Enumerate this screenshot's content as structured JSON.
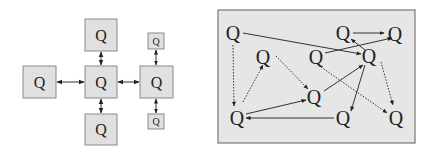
{
  "left_diagram": {
    "title": "centralized topology",
    "nodes": [
      {
        "id": "top",
        "label": "Q"
      },
      {
        "id": "left",
        "label": "Q"
      },
      {
        "id": "center",
        "label": "Q"
      },
      {
        "id": "right",
        "label": "Q"
      },
      {
        "id": "bottom",
        "label": "Q"
      },
      {
        "id": "small-top",
        "label": "Q"
      },
      {
        "id": "small-bottom",
        "label": "Q"
      }
    ],
    "edges": [
      {
        "from": "center",
        "to": "top",
        "type": "bidirectional"
      },
      {
        "from": "center",
        "to": "left",
        "type": "bidirectional"
      },
      {
        "from": "center",
        "to": "right",
        "type": "bidirectional"
      },
      {
        "from": "center",
        "to": "bottom",
        "type": "bidirectional"
      },
      {
        "from": "right",
        "to": "small-top",
        "type": "bidirectional"
      },
      {
        "from": "right",
        "to": "small-bottom",
        "type": "bidirectional"
      }
    ]
  },
  "right_diagram": {
    "title": "decentralized network",
    "nodes": [
      {
        "id": "a",
        "label": "Q"
      },
      {
        "id": "b",
        "label": "Q"
      },
      {
        "id": "c",
        "label": "Q"
      },
      {
        "id": "d",
        "label": "Q"
      },
      {
        "id": "e",
        "label": "Q"
      },
      {
        "id": "f",
        "label": "Q"
      },
      {
        "id": "g",
        "label": "Q"
      },
      {
        "id": "h",
        "label": "Q"
      },
      {
        "id": "i",
        "label": "Q"
      },
      {
        "id": "j",
        "label": "Q"
      }
    ],
    "edges": [
      {
        "from": "a",
        "to": "d",
        "style": "solid"
      },
      {
        "from": "a",
        "to": "h",
        "style": "dotted"
      },
      {
        "from": "e",
        "to": "f",
        "style": "solid"
      },
      {
        "from": "c",
        "to": "f",
        "style": "solid"
      },
      {
        "from": "d",
        "to": "e",
        "style": "solid"
      },
      {
        "from": "b",
        "to": "g",
        "style": "dotted"
      },
      {
        "from": "h",
        "to": "b",
        "style": "dotted"
      },
      {
        "from": "h",
        "to": "g",
        "style": "solid"
      },
      {
        "from": "g",
        "to": "d",
        "style": "solid"
      },
      {
        "from": "d",
        "to": "i",
        "style": "solid"
      },
      {
        "from": "d",
        "to": "j",
        "style": "dotted"
      },
      {
        "from": "c",
        "to": "j",
        "style": "dotted"
      },
      {
        "from": "i",
        "to": "h",
        "style": "solid"
      }
    ]
  }
}
